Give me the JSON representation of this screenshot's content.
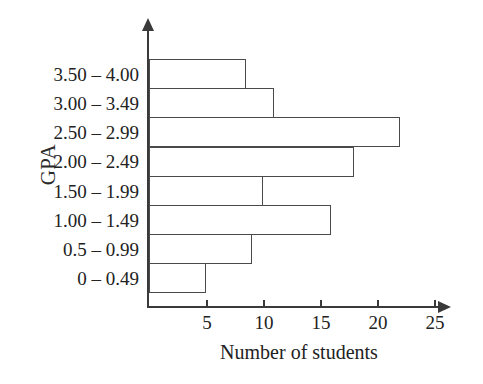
{
  "chart_data": {
    "type": "bar",
    "orientation": "horizontal",
    "title": "",
    "xlabel": "Number of students",
    "ylabel": "GPA",
    "categories": [
      "3.50 – 4.00",
      "3.00 – 3.49",
      "2.50 – 2.99",
      "2.00 – 2.49",
      "1.50 – 1.99",
      "1.00 – 1.49",
      "0.5 – 0.99",
      "0 – 0.49"
    ],
    "values": [
      8.5,
      11,
      22,
      18,
      10,
      16,
      9,
      5
    ],
    "xlim": [
      0,
      26
    ],
    "xticks": [
      5,
      10,
      15,
      20,
      25
    ],
    "xtick_labels": [
      "5",
      "10",
      "15",
      "20",
      "25"
    ],
    "grid": false,
    "legend": false,
    "bar_fill_color": "#ffffff",
    "bar_edge_color": "#4a4a4a",
    "axis_color": "#3a3a3a"
  },
  "axes": {
    "y_title": "GPA",
    "x_title": "Number of students"
  }
}
